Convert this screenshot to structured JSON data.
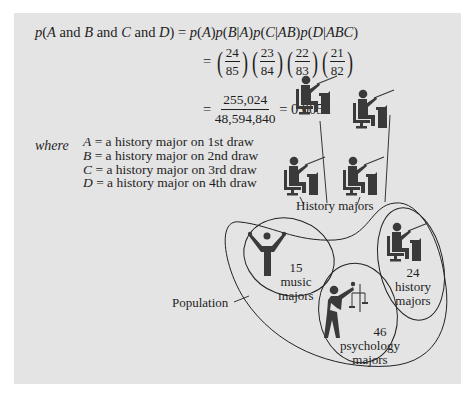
{
  "equation": {
    "lhs": {
      "p": "p",
      "open": "(",
      "A": "A",
      "and1": " and ",
      "B": "B",
      "and2": " and ",
      "C": "C",
      "and3": " and ",
      "D": "D",
      "close": ")"
    },
    "rhs_line1": "= p(A)p(B|A)p(C|AB)p(D|ABC)",
    "rhs_line1_parts": [
      "p(",
      "A",
      ")p(",
      "B",
      "|",
      "A",
      ")p(",
      "C",
      "|",
      "AB",
      ")p(",
      "D",
      "|",
      "ABC",
      ")"
    ],
    "equals": "=",
    "fractions": [
      {
        "num": "24",
        "den": "85"
      },
      {
        "num": "23",
        "den": "84"
      },
      {
        "num": "22",
        "den": "83"
      },
      {
        "num": "21",
        "den": "82"
      }
    ],
    "product": {
      "num": "255,024",
      "den": "48,594,840"
    },
    "result": "= 0.0052"
  },
  "where": {
    "label": "where",
    "definitions": [
      {
        "var": "A",
        "text": " = a history major on 1st draw"
      },
      {
        "var": "B",
        "text": " = a history major on 2nd draw"
      },
      {
        "var": "C",
        "text": " = a history major on 3rd draw"
      },
      {
        "var": "D",
        "text": " = a history major on 4th draw"
      }
    ]
  },
  "diagram": {
    "sample_label": "History majors",
    "population_label": "Population",
    "groups": [
      {
        "count": "15",
        "line1": "music",
        "line2": "majors",
        "icon": "music-major-icon"
      },
      {
        "count": "46",
        "line1": "psychology",
        "line2": "majors",
        "icon": "psychology-major-icon"
      },
      {
        "count": "24",
        "line1": "history",
        "line2": "majors",
        "icon": "history-major-icon"
      }
    ],
    "sampled_icons": [
      "history-major-icon",
      "history-major-icon",
      "history-major-icon",
      "history-major-icon"
    ]
  },
  "colors": {
    "background": "#e4e4e4",
    "ink": "#1e1e1e",
    "icon": "#3a3a3a"
  }
}
